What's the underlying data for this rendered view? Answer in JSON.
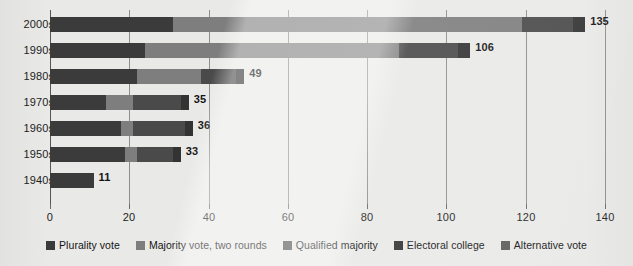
{
  "chart_data": {
    "type": "bar",
    "orientation": "horizontal",
    "stacked": true,
    "title": "",
    "subtitle": "",
    "xlabel": "",
    "ylabel": "",
    "xlim": [
      0,
      140
    ],
    "xticks": [
      0,
      20,
      40,
      60,
      80,
      100,
      120,
      140
    ],
    "xtick_labels": [
      "0",
      "20",
      "40",
      "60",
      "80",
      "100",
      "120",
      "140"
    ],
    "grid": true,
    "grid_axis": "x",
    "legend_position": "bottom-center",
    "categories": [
      "2000s",
      "1990s",
      "1980s",
      "1970s",
      "1960s",
      "1950s",
      "1940s"
    ],
    "series": [
      {
        "name": "Plurality vote",
        "color": "#3b3b3b",
        "values": [
          31,
          24,
          22,
          14,
          18,
          19,
          11
        ]
      },
      {
        "name": "Majority vote, two rounds",
        "color": "#7e7e7e",
        "values": [
          88,
          64,
          16,
          7,
          3,
          3,
          0
        ]
      },
      {
        "name": "Qualified majority",
        "color": "#4a4a4a",
        "values": [
          13,
          15,
          9,
          12,
          13,
          9,
          0
        ]
      },
      {
        "name": "Electoral college",
        "color": "#333333",
        "values": [
          3,
          3,
          2,
          2,
          2,
          2,
          0
        ]
      },
      {
        "name": "Alternative vote",
        "color": "#5c5c5c",
        "values": [
          0,
          0,
          0,
          0,
          0,
          0,
          0
        ]
      }
    ],
    "totals": [
      135,
      106,
      49,
      35,
      36,
      33,
      11
    ],
    "total_labels": [
      "135",
      "106",
      "49",
      "35",
      "36",
      "33",
      "11"
    ]
  },
  "legend": {
    "items": [
      {
        "label": "Plurality vote",
        "color": "#3b3b3b"
      },
      {
        "label": "Majority vote, two rounds",
        "color": "#7e7e7e"
      },
      {
        "label": "Qualified majority",
        "color": "#4a4a4a"
      },
      {
        "label": "Electoral college",
        "color": "#333333"
      },
      {
        "label": "Alternative vote",
        "color": "#5c5c5c"
      }
    ]
  },
  "theme": {
    "background": "#e9e9e7",
    "gridline": "#8e8e8c",
    "axis": "#56565a",
    "text": "#1c1c1c"
  }
}
